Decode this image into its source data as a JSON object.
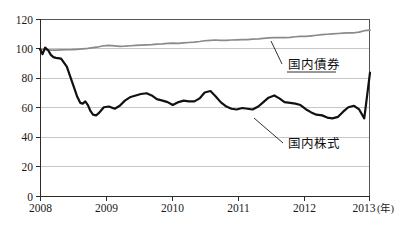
{
  "chart_data": {
    "type": "line",
    "title": "",
    "subtitle": "",
    "xlabel": "",
    "ylabel": "",
    "xunit": "(年)",
    "xlim": [
      2008,
      2013.17
    ],
    "ylim": [
      0,
      120
    ],
    "grid": true,
    "gridlines_y": [
      20,
      40,
      60,
      80,
      100
    ],
    "legend_position": "inline-annotation",
    "x_tick_labels": [
      "2008",
      "2009",
      "2010",
      "2011",
      "2012",
      "2013"
    ],
    "x_tick_values": [
      2008,
      2009,
      2010,
      2011,
      2012,
      2013
    ],
    "y_tick_labels": [
      "0",
      "20",
      "40",
      "60",
      "80",
      "100",
      "120"
    ],
    "y_tick_values": [
      0,
      20,
      40,
      60,
      80,
      100,
      120
    ],
    "series": [
      {
        "name": "国内債券",
        "color": "#8a8a8a",
        "style": "solid-gray",
        "x": [
          2008.0,
          2008.08,
          2008.17,
          2008.25,
          2008.33,
          2008.42,
          2008.5,
          2008.58,
          2008.67,
          2008.75,
          2008.83,
          2008.92,
          2009.0,
          2009.08,
          2009.17,
          2009.25,
          2009.33,
          2009.42,
          2009.5,
          2009.58,
          2009.67,
          2009.75,
          2009.83,
          2009.92,
          2010.0,
          2010.08,
          2010.17,
          2010.25,
          2010.33,
          2010.42,
          2010.5,
          2010.58,
          2010.67,
          2010.75,
          2010.83,
          2010.92,
          2011.0,
          2011.08,
          2011.17,
          2011.25,
          2011.33,
          2011.42,
          2011.5,
          2011.58,
          2011.67,
          2011.75,
          2011.83,
          2011.92,
          2012.0,
          2012.08,
          2012.17,
          2012.25,
          2012.33,
          2012.42,
          2012.5,
          2012.58,
          2012.67,
          2012.75,
          2012.83,
          2012.92,
          2013.0,
          2013.08,
          2013.17
        ],
        "values": [
          100.0,
          99.6,
          99.3,
          99.2,
          99.4,
          99.5,
          99.6,
          99.8,
          100.1,
          100.4,
          100.9,
          101.5,
          102.2,
          102.5,
          102.1,
          101.8,
          101.9,
          102.2,
          102.4,
          102.6,
          102.8,
          103.0,
          103.3,
          103.5,
          103.8,
          104.0,
          103.8,
          104.1,
          104.4,
          104.7,
          105.1,
          105.6,
          105.9,
          106.1,
          105.9,
          105.8,
          106.1,
          106.2,
          106.3,
          106.4,
          106.7,
          106.9,
          107.2,
          107.5,
          107.7,
          107.8,
          107.7,
          107.9,
          108.3,
          108.6,
          108.5,
          108.9,
          109.3,
          109.7,
          110.0,
          110.3,
          110.5,
          110.7,
          110.9,
          111.0,
          111.4,
          112.4,
          112.8
        ]
      },
      {
        "name": "国内株式",
        "color": "#111111",
        "style": "solid-black-bold",
        "x": [
          2008.0,
          2008.04,
          2008.08,
          2008.13,
          2008.17,
          2008.21,
          2008.25,
          2008.33,
          2008.42,
          2008.5,
          2008.58,
          2008.63,
          2008.67,
          2008.71,
          2008.75,
          2008.79,
          2008.83,
          2008.88,
          2008.92,
          2008.96,
          2009.0,
          2009.08,
          2009.17,
          2009.25,
          2009.33,
          2009.42,
          2009.5,
          2009.58,
          2009.67,
          2009.75,
          2009.83,
          2009.92,
          2010.0,
          2010.08,
          2010.17,
          2010.25,
          2010.33,
          2010.42,
          2010.5,
          2010.58,
          2010.67,
          2010.75,
          2010.83,
          2010.92,
          2011.0,
          2011.08,
          2011.17,
          2011.25,
          2011.33,
          2011.42,
          2011.5,
          2011.58,
          2011.67,
          2011.75,
          2011.83,
          2011.92,
          2012.0,
          2012.08,
          2012.17,
          2012.25,
          2012.33,
          2012.42,
          2012.5,
          2012.58,
          2012.67,
          2012.75,
          2012.83,
          2012.92,
          2013.0,
          2013.08,
          2013.17
        ],
        "values": [
          100.0,
          96.5,
          101.0,
          99.0,
          96.0,
          94.5,
          94.0,
          93.5,
          88.0,
          78.0,
          68.0,
          63.5,
          63.0,
          64.5,
          62.0,
          58.0,
          55.5,
          55.0,
          56.5,
          58.5,
          60.5,
          61.0,
          59.5,
          61.5,
          65.0,
          67.5,
          68.5,
          69.5,
          70.0,
          68.5,
          66.0,
          65.0,
          64.0,
          62.0,
          64.0,
          65.0,
          64.5,
          64.5,
          66.5,
          70.5,
          71.5,
          68.0,
          64.0,
          61.0,
          59.5,
          59.0,
          60.0,
          59.5,
          59.0,
          61.0,
          64.0,
          67.0,
          68.5,
          66.5,
          64.0,
          63.5,
          63.0,
          62.0,
          59.0,
          57.0,
          55.5,
          55.0,
          53.5,
          53.0,
          54.0,
          57.5,
          60.5,
          61.5,
          59.0,
          53.0,
          84.0
        ]
      }
    ],
    "annotations": [
      {
        "id": "bonds-label",
        "text": "国内債券",
        "label_x": 288,
        "label_y": 69,
        "leader_from_x": 282,
        "leader_from_y": 64,
        "leader_to_x": 271,
        "leader_to_y": 41,
        "underline": true,
        "underline_x1": 287,
        "underline_x2": 336,
        "underline_y": 72
      },
      {
        "id": "stocks-label",
        "text": "国内株式",
        "label_x": 288,
        "label_y": 148,
        "leader_from_x": 283,
        "leader_from_y": 143,
        "leader_to_x": 254,
        "leader_to_y": 118,
        "underline": false
      }
    ]
  },
  "axes": {
    "y_axis_name": "index-value-axis",
    "x_axis_name": "year-axis",
    "x_unit_text": "(年)"
  },
  "colors": {
    "bonds_line": "#8a8a8a",
    "stocks_line": "#111111",
    "gridline": "#b8b8b8",
    "axis": "#2b2b2b",
    "background": "#ffffff",
    "text": "#1a1a1a"
  }
}
